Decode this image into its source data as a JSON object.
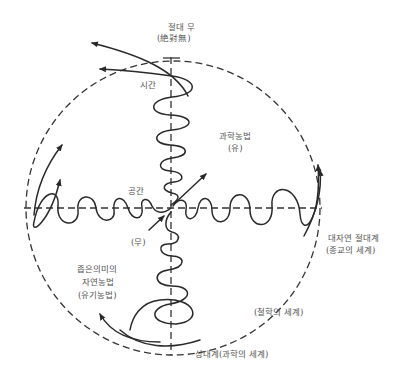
{
  "labels": {
    "top_title": "절대 무",
    "top_subtitle": "(絶對無)",
    "time": "시간",
    "space": "공간",
    "science_farming": "과학농법",
    "science_farming_sub": "(유)",
    "nothing": "(무)",
    "nature_absolute": "대자연 절대계",
    "nature_absolute_sub": "(종교의 세계)",
    "narrow_line1": "좁은의미의",
    "narrow_line2": "자연농법",
    "narrow_line3": "(유기농법)",
    "philosophy": "(철학의 세계)",
    "relative": "상대계(과학의 세계)"
  },
  "colors": {
    "line": "#2a2a2a",
    "text": "#555555",
    "background": "#ffffff"
  }
}
